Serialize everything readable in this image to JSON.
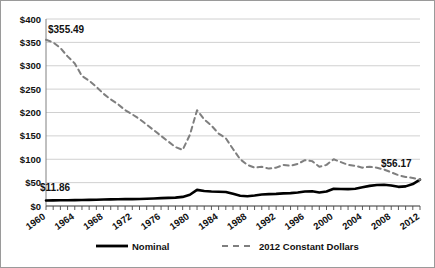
{
  "chart_data": {
    "type": "line",
    "title": "",
    "xlabel": "",
    "ylabel": "",
    "ylim": [
      0,
      400
    ],
    "ytick_step": 50,
    "grid": true,
    "legend_position": "bottom",
    "x_tick_labels": [
      "1960",
      "1964",
      "1968",
      "1972",
      "1976",
      "1980",
      "1984",
      "1988",
      "1992",
      "1996",
      "2000",
      "2004",
      "2008",
      "2012"
    ],
    "y_tick_labels": [
      "$0",
      "$50",
      "$100",
      "$150",
      "$200",
      "$250",
      "$300",
      "$350",
      "$400"
    ],
    "x": [
      1960,
      1961,
      1962,
      1963,
      1964,
      1965,
      1966,
      1967,
      1968,
      1969,
      1970,
      1971,
      1972,
      1973,
      1974,
      1975,
      1976,
      1977,
      1978,
      1979,
      1980,
      1981,
      1982,
      1983,
      1984,
      1985,
      1986,
      1987,
      1988,
      1989,
      1990,
      1991,
      1992,
      1993,
      1994,
      1995,
      1996,
      1997,
      1998,
      1999,
      2000,
      2001,
      2002,
      2003,
      2004,
      2005,
      2006,
      2007,
      2008,
      2009,
      2010,
      2011,
      2012
    ],
    "series": [
      {
        "name": "Nominal",
        "style": "solid",
        "color": "#000000",
        "values": [
          11.86,
          12.0,
          12.2,
          12.4,
          12.6,
          12.9,
          13.2,
          13.5,
          13.8,
          14.1,
          14.4,
          14.6,
          14.8,
          15.1,
          15.6,
          16.2,
          16.8,
          17.4,
          18.0,
          19.5,
          24.0,
          34.5,
          32.0,
          31.0,
          30.5,
          30.0,
          26.0,
          22.0,
          21.0,
          22.5,
          24.5,
          25.5,
          26.0,
          27.0,
          27.5,
          29.0,
          31.0,
          31.5,
          29.0,
          31.0,
          37.0,
          36.5,
          36.0,
          37.0,
          40.0,
          43.0,
          45.0,
          45.5,
          44.0,
          41.0,
          42.0,
          47.0,
          56.17
        ]
      },
      {
        "name": "2012 Constant Dollars",
        "style": "dashed",
        "color": "#7f7f7f",
        "values": [
          355.49,
          350.0,
          338.0,
          320.0,
          305.0,
          278.0,
          268.0,
          255.0,
          240.0,
          228.0,
          218.0,
          205.0,
          196.0,
          186.0,
          174.0,
          162.0,
          150.0,
          138.0,
          126.0,
          120.0,
          152.0,
          205.0,
          185.0,
          172.0,
          155.0,
          145.0,
          122.0,
          100.0,
          88.0,
          82.0,
          84.0,
          80.0,
          82.0,
          88.0,
          86.0,
          90.0,
          98.0,
          96.0,
          84.0,
          88.0,
          100.0,
          94.0,
          88.0,
          86.0,
          82.0,
          84.0,
          82.0,
          78.0,
          72.0,
          66.0,
          62.0,
          60.0,
          56.17
        ]
      }
    ],
    "annotations": [
      {
        "label": "$355.49",
        "series": "2012 Constant Dollars",
        "x": 1960
      },
      {
        "label": "$11.86",
        "series": "Nominal",
        "x": 1960
      },
      {
        "label": "$56.17",
        "series": "Nominal",
        "x": 2012
      }
    ]
  }
}
